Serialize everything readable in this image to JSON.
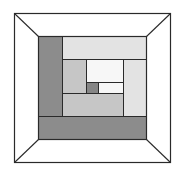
{
  "diagram": {
    "title": "",
    "canvas": {
      "width": 182,
      "height": 176,
      "background": "#ffffff"
    },
    "outer_frame": {
      "x": 14,
      "y": 13,
      "w": 156,
      "h": 149,
      "stroke": "#2a2a2a"
    },
    "inner_square": {
      "x": 38,
      "y": 36,
      "w": 108,
      "h": 103
    },
    "corner_lines": [
      {
        "x1": 14,
        "y1": 13,
        "x2": 38,
        "y2": 36
      },
      {
        "x1": 170,
        "y1": 13,
        "x2": 146,
        "y2": 36
      },
      {
        "x1": 14,
        "y1": 162,
        "x2": 38,
        "y2": 139
      },
      {
        "x1": 170,
        "y1": 162,
        "x2": 146,
        "y2": 139
      }
    ],
    "colors": {
      "dark": "#8c8c8c",
      "center": "#858585",
      "medium": "#c6c6c6",
      "light": "#e3e3e3",
      "white": "#f7f7f7",
      "stroke": "#2a2a2a"
    },
    "patches": [
      {
        "name": "left-dark-strip",
        "x": 38,
        "y": 36,
        "w": 24,
        "h": 80,
        "tone": "dark"
      },
      {
        "name": "top-light-strip",
        "x": 62,
        "y": 36,
        "w": 84,
        "h": 23,
        "tone": "light"
      },
      {
        "name": "right-light-strip",
        "x": 123,
        "y": 59,
        "w": 23,
        "h": 57,
        "tone": "light"
      },
      {
        "name": "inner-left-medium-strip",
        "x": 62,
        "y": 59,
        "w": 24,
        "h": 34,
        "tone": "medium"
      },
      {
        "name": "inner-top-white-strip",
        "x": 86,
        "y": 59,
        "w": 37,
        "h": 23,
        "tone": "white"
      },
      {
        "name": "center-square",
        "x": 86,
        "y": 82,
        "w": 12,
        "h": 11,
        "tone": "center"
      },
      {
        "name": "inner-right-white-strip",
        "x": 98,
        "y": 82,
        "w": 25,
        "h": 11,
        "tone": "white"
      },
      {
        "name": "inner-bottom-medium-strip",
        "x": 62,
        "y": 93,
        "w": 61,
        "h": 23,
        "tone": "medium"
      },
      {
        "name": "bottom-dark-strip",
        "x": 38,
        "y": 116,
        "w": 108,
        "h": 23,
        "tone": "dark"
      }
    ]
  }
}
